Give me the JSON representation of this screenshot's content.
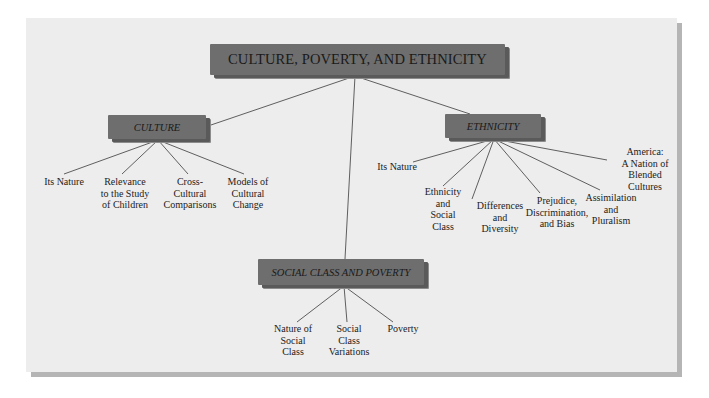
{
  "title": "CULTURE, POVERTY, AND ETHNICITY",
  "nodes": {
    "culture": {
      "label": "CULTURE",
      "children": [
        {
          "lines": [
            "Its Nature"
          ]
        },
        {
          "lines": [
            "Relevance",
            "to the Study",
            "of Children"
          ]
        },
        {
          "lines": [
            "Cross-",
            "Cultural",
            "Comparisons"
          ]
        },
        {
          "lines": [
            "Models of",
            "Cultural",
            "Change"
          ]
        }
      ]
    },
    "ethnicity": {
      "label": "ETHNICITY",
      "children": [
        {
          "lines": [
            "Its Nature"
          ]
        },
        {
          "lines": [
            "Ethnicity",
            "and",
            "Social",
            "Class"
          ]
        },
        {
          "lines": [
            "Differences",
            "and",
            "Diversity"
          ]
        },
        {
          "lines": [
            "Prejudice,",
            "Discrimination,",
            "and Bias"
          ]
        },
        {
          "lines": [
            "Assimilation",
            "and",
            "Pluralism"
          ]
        },
        {
          "lines": [
            "America:",
            "A Nation of",
            "Blended",
            "Cultures"
          ]
        }
      ]
    },
    "social": {
      "label": "SOCIAL CLASS AND POVERTY",
      "children": [
        {
          "lines": [
            "Nature of",
            "Social",
            "Class"
          ]
        },
        {
          "lines": [
            "Social",
            "Class",
            "Variations"
          ]
        },
        {
          "lines": [
            "Poverty"
          ]
        }
      ]
    }
  },
  "colors": {
    "panel": "#ededed",
    "box": "#6e6e6e",
    "line": "#3a3a3a"
  }
}
